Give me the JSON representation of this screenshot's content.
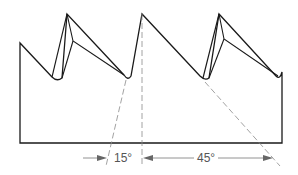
{
  "diagram": {
    "colors": {
      "outline": "#1a1a1a",
      "construction_lines": "#8a8a8a",
      "dimension": "#777777",
      "text": "#555555"
    },
    "annotations": {
      "rake_angle": "15°",
      "clearance_angle": "45°"
    }
  }
}
